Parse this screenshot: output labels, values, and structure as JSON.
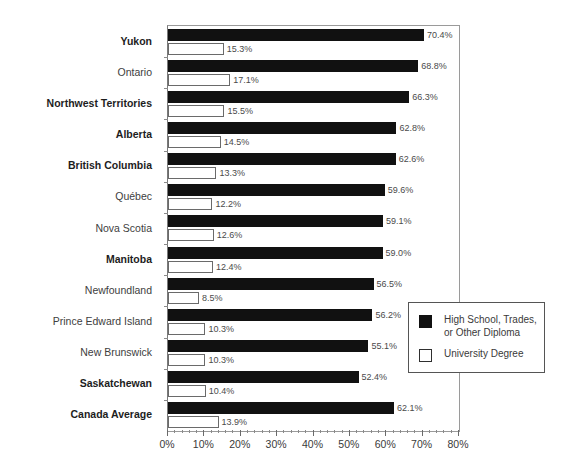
{
  "chart_data": {
    "type": "bar",
    "orientation": "horizontal",
    "title": "",
    "xlabel": "",
    "ylabel": "",
    "xlim": [
      0,
      80
    ],
    "grid": false,
    "legend_position": "inside-bottom-right",
    "xticks": [
      "0%",
      "10%",
      "20%",
      "30%",
      "40%",
      "50%",
      "60%",
      "70%",
      "80%"
    ],
    "xtick_values": [
      0,
      10,
      20,
      30,
      40,
      50,
      60,
      70,
      80
    ],
    "minor_tick_step": 2,
    "categories": [
      "Yukon",
      "Ontario",
      "Northwest Territories",
      "Alberta",
      "British Columbia",
      "Québec",
      "Nova Scotia",
      "Manitoba",
      "Newfoundland",
      "Prince Edward Island",
      "New Brunswick",
      "Saskatchewan",
      "Canada Average"
    ],
    "category_emphasis": [
      true,
      false,
      true,
      true,
      true,
      false,
      false,
      true,
      false,
      false,
      false,
      true,
      true
    ],
    "series": [
      {
        "name": "High School, Trades, or Other Diploma",
        "style": "filled",
        "color": "#111111",
        "values": [
          70.4,
          68.8,
          66.3,
          62.8,
          62.6,
          59.6,
          59.1,
          59.0,
          56.5,
          56.2,
          55.1,
          52.4,
          62.1
        ],
        "labels": [
          "70.4%",
          "68.8%",
          "66.3%",
          "62.8%",
          "62.6%",
          "59.6%",
          "59.1%",
          "59.0%",
          "56.5%",
          "56.2%",
          "55.1%",
          "52.4%",
          "62.1%"
        ]
      },
      {
        "name": "University Degree",
        "style": "outlined",
        "color": "#ffffff",
        "border_color": "#6a6a6a",
        "values": [
          15.3,
          17.1,
          15.5,
          14.5,
          13.3,
          12.2,
          12.6,
          12.4,
          8.5,
          10.3,
          10.3,
          10.4,
          13.9
        ],
        "labels": [
          "15.3%",
          "17.1%",
          "15.5%",
          "14.5%",
          "13.3%",
          "12.2%",
          "12.6%",
          "12.4%",
          "8.5%",
          "10.3%",
          "10.3%",
          "10.4%",
          "13.9%"
        ]
      }
    ]
  },
  "legend": {
    "entries": [
      {
        "label": "High School, Trades,\nor Other Diploma",
        "swatch": "filled-square",
        "swatch_class": "dark"
      },
      {
        "label": "University Degree",
        "swatch": "outlined-square",
        "swatch_class": "light"
      }
    ]
  },
  "colors": {
    "series_dark": "#111111",
    "series_light": "#ffffff",
    "axis": "#6a6a6a",
    "plot_border": "#9a9a9a",
    "text": "#3a3a3a",
    "background": "#ffffff"
  }
}
